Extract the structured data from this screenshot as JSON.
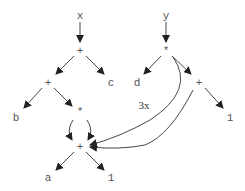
{
  "diagram": {
    "nodes": [
      {
        "id": "x",
        "label": "x",
        "x": 80,
        "y": 15
      },
      {
        "id": "plus1",
        "label": "+",
        "x": 80,
        "y": 50
      },
      {
        "id": "plus2",
        "label": "+",
        "x": 48,
        "y": 82
      },
      {
        "id": "c",
        "label": "c",
        "x": 111,
        "y": 82
      },
      {
        "id": "b",
        "label": "b",
        "x": 16,
        "y": 117
      },
      {
        "id": "mul1",
        "label": "*",
        "x": 80,
        "y": 111
      },
      {
        "id": "plus3",
        "label": "+",
        "x": 80,
        "y": 146
      },
      {
        "id": "a",
        "label": "a",
        "x": 48,
        "y": 177
      },
      {
        "id": "one1",
        "label": "1",
        "x": 111,
        "y": 177
      },
      {
        "id": "y",
        "label": "y",
        "x": 166,
        "y": 15
      },
      {
        "id": "mul2",
        "label": "*",
        "x": 166,
        "y": 50
      },
      {
        "id": "d",
        "label": "d",
        "x": 137,
        "y": 82
      },
      {
        "id": "plus4",
        "label": "+",
        "x": 199,
        "y": 82
      },
      {
        "id": "one2",
        "label": "1",
        "x": 230,
        "y": 117
      }
    ],
    "edge_label": "3x"
  }
}
